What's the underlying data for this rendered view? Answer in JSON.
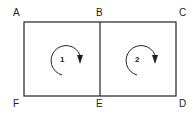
{
  "diagram": {
    "nodes": {
      "A": "A",
      "B": "B",
      "C": "C",
      "D": "D",
      "E": "E",
      "F": "F"
    },
    "edges": [
      [
        "A",
        "B"
      ],
      [
        "B",
        "C"
      ],
      [
        "C",
        "D"
      ],
      [
        "D",
        "E"
      ],
      [
        "E",
        "F"
      ],
      [
        "F",
        "A"
      ],
      [
        "B",
        "E"
      ]
    ],
    "loops": [
      {
        "label": "1",
        "direction": "clockwise",
        "bounded_by": [
          "A",
          "B",
          "E",
          "F"
        ]
      },
      {
        "label": "2",
        "direction": "clockwise",
        "bounded_by": [
          "B",
          "C",
          "D",
          "E"
        ]
      }
    ],
    "colors": {
      "line": "#222222",
      "background": "#ffffff"
    }
  }
}
